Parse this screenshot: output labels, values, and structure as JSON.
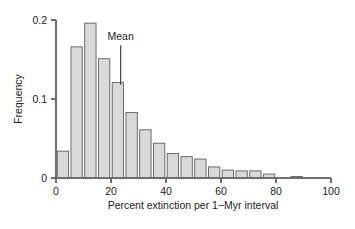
{
  "chart_data": {
    "type": "bar",
    "title": "",
    "subtitle": "",
    "xlabel": "Percent extinction per 1−Myr interval",
    "ylabel": "Frequency",
    "xlim": [
      0,
      100
    ],
    "ylim": [
      0,
      0.2
    ],
    "xticks": [
      0,
      20,
      40,
      60,
      80,
      100
    ],
    "xtick_labels": [
      "0",
      "20",
      "40",
      "60",
      "80",
      "100"
    ],
    "yticks": [
      0,
      0.1,
      0.2
    ],
    "ytick_labels": [
      "0",
      "0.1",
      "0.2"
    ],
    "grid": false,
    "legend": null,
    "bin_width": 5,
    "bin_starts": [
      0,
      5,
      10,
      15,
      20,
      25,
      30,
      35,
      40,
      45,
      50,
      55,
      60,
      65,
      70,
      75,
      80,
      85
    ],
    "categories": [
      "0–5",
      "5–10",
      "10–15",
      "15–20",
      "20–25",
      "25–30",
      "30–35",
      "35–40",
      "40–45",
      "45–50",
      "50–55",
      "55–60",
      "60–65",
      "65–70",
      "70–75",
      "75–80",
      "80–85",
      "85–90"
    ],
    "values": [
      0.034,
      0.166,
      0.196,
      0.151,
      0.121,
      0.083,
      0.061,
      0.044,
      0.031,
      0.027,
      0.024,
      0.014,
      0.01,
      0.009,
      0.009,
      0.005,
      0.0,
      0.002
    ],
    "annotations": [
      {
        "label": "Mean",
        "x": 23.5,
        "pointer": true,
        "pointer_y_top": 0.168,
        "pointer_y_bottom": 0.118
      }
    ]
  },
  "figure": {
    "background_color": "#ffffff",
    "bar_fill_color": "#d9d9d9",
    "bar_edge_color": "#5f5f5f",
    "axis_color": "#6e6e6e",
    "text_color": "#1c1c1c"
  }
}
